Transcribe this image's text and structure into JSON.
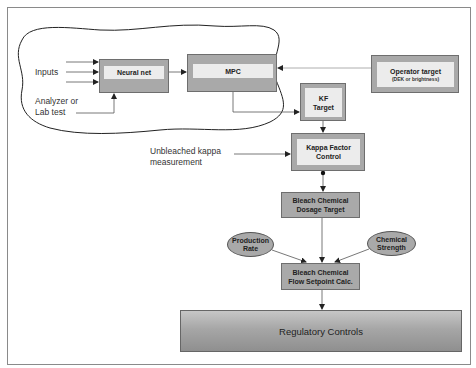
{
  "diagram": {
    "nodes": {
      "neural_net": {
        "label": "Neural net"
      },
      "mpc": {
        "label": "MPC"
      },
      "operator_target": {
        "label": "Operator target",
        "sublabel": "(DEK or brightness)"
      },
      "kf_target": {
        "line1": "KF",
        "line2": "Target"
      },
      "kappa_factor_control": {
        "line1": "Kappa Factor",
        "line2": "Control"
      },
      "dosage_target": {
        "line1": "Bleach Chemical",
        "line2": "Dosage Target"
      },
      "production_rate": {
        "line1": "Production",
        "line2": "Rate"
      },
      "chemical_strength": {
        "line1": "Chemical",
        "line2": "Strength"
      },
      "flow_setpoint": {
        "line1": "Bleach Chemical",
        "line2": "Flow Setpoint Calc."
      },
      "regulatory_controls": {
        "label": "Regulatory Controls"
      }
    },
    "annotations": {
      "inputs": "Inputs",
      "analyzer_line1": "Analyzer or",
      "analyzer_line2": "Lab test",
      "unbleached_line1": "Unbleached kappa",
      "unbleached_line2": "measurement"
    },
    "edges": [
      {
        "from": "inputs",
        "to": "neural_net",
        "count": 3
      },
      {
        "from": "analyzer_or_lab_test",
        "to": "neural_net"
      },
      {
        "from": "neural_net",
        "to": "mpc"
      },
      {
        "from": "operator_target",
        "to": "mpc"
      },
      {
        "from": "mpc",
        "to": "kf_target"
      },
      {
        "from": "kf_target",
        "to": "kappa_factor_control"
      },
      {
        "from": "unbleached_kappa_measurement",
        "to": "kappa_factor_control"
      },
      {
        "from": "kappa_factor_control",
        "to": "dosage_target"
      },
      {
        "from": "dosage_target",
        "to": "flow_setpoint"
      },
      {
        "from": "production_rate",
        "to": "flow_setpoint"
      },
      {
        "from": "chemical_strength",
        "to": "flow_setpoint"
      },
      {
        "from": "flow_setpoint",
        "to": "regulatory_controls"
      }
    ],
    "colors": {
      "box_fill": "#a9a9a9",
      "inner_fill": "#ececec",
      "line": "#555555",
      "frame": "#8a8a8a"
    }
  }
}
